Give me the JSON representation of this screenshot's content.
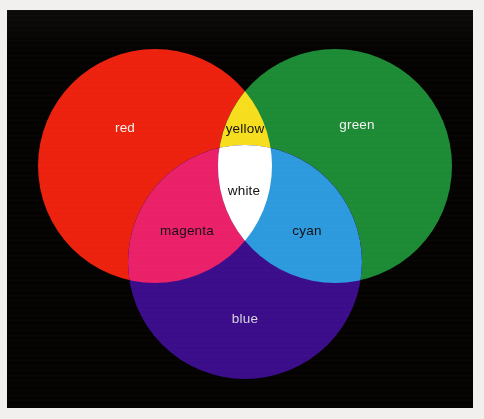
{
  "figure": {
    "background_color": "#f2f0ee",
    "plate_color": "#040302"
  },
  "chart_data": {
    "type": "diagram",
    "subtype": "venn",
    "title": "",
    "xlabel": "",
    "ylabel": "",
    "legend_position": "none",
    "grid": false,
    "sets": [
      {
        "name": "red",
        "label": "red",
        "color": "#ec220e",
        "cx": 148,
        "cy": 156,
        "r": 117,
        "label_x": 118,
        "label_y": 122,
        "label_fill": "#f4f2f0"
      },
      {
        "name": "green",
        "label": "green",
        "color": "#1d8b36",
        "cx": 328,
        "cy": 156,
        "r": 117,
        "label_x": 350,
        "label_y": 119,
        "label_fill": "#f4f2f0"
      },
      {
        "name": "blue",
        "label": "blue",
        "color": "#3b0d8a",
        "cx": 238,
        "cy": 252,
        "r": 117,
        "label_x": 238,
        "label_y": 313,
        "label_fill": "#d8d3dc"
      }
    ],
    "intersections": [
      {
        "name": "yellow",
        "label": "yellow",
        "of": [
          "red",
          "green"
        ],
        "color": "#f6de1e",
        "label_x": 238,
        "label_y": 123,
        "label_fill": "#141014"
      },
      {
        "name": "magenta",
        "label": "magenta",
        "of": [
          "red",
          "blue"
        ],
        "color": "#ea2069",
        "label_x": 180,
        "label_y": 225,
        "label_fill": "#141014"
      },
      {
        "name": "cyan",
        "label": "cyan",
        "of": [
          "green",
          "blue"
        ],
        "color": "#2d9ade",
        "label_x": 300,
        "label_y": 225,
        "label_fill": "#141014"
      },
      {
        "name": "white",
        "label": "white",
        "of": [
          "red",
          "green",
          "blue"
        ],
        "color": "#ffffff",
        "label_x": 237,
        "label_y": 185,
        "label_fill": "#141014"
      }
    ]
  }
}
